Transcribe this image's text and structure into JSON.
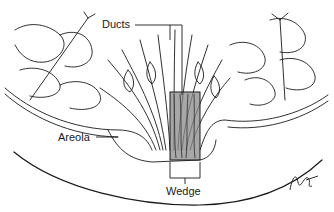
{
  "figure": {
    "labels": {
      "ducts": "Ducts",
      "areola": "Areola",
      "wedge": "Wedge"
    },
    "signature": "JKG",
    "colors": {
      "line": "#1a1a1a",
      "wedge_fill": "#8a8a8a",
      "shading": "#c8c8c8",
      "background": "#ffffff"
    }
  }
}
